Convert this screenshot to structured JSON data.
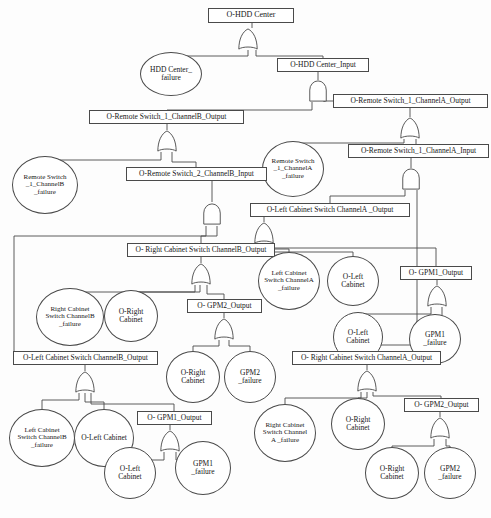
{
  "diagram": {
    "type": "fault-tree",
    "caption": "",
    "stroke_color": "#4a4a4a",
    "background_color": "#fdfdfd",
    "text_color": "#161616"
  },
  "nodes": [
    {
      "id": "n0",
      "label": "O-HDD Center",
      "shape": "rect",
      "x": 208,
      "y": 8,
      "w": 86,
      "h": 15,
      "font": 8
    },
    {
      "id": "n1",
      "label": "HDD Center_\nfailure",
      "shape": "circle",
      "x": 140,
      "y": 52,
      "w": 62,
      "h": 44,
      "font": 7.5
    },
    {
      "id": "n2",
      "label": "O-HDD Center_Input",
      "shape": "rect",
      "x": 277,
      "y": 58,
      "w": 92,
      "h": 14,
      "font": 7.5
    },
    {
      "id": "n3",
      "label": "O-Remote Switch_1_ChannelA_Output",
      "shape": "rect",
      "x": 333,
      "y": 94,
      "w": 155,
      "h": 14,
      "font": 7.5
    },
    {
      "id": "n4",
      "label": "O-Remote Switch_1_ChannelB_Output",
      "shape": "rect",
      "x": 89,
      "y": 110,
      "w": 155,
      "h": 14,
      "font": 7.5
    },
    {
      "id": "n5",
      "label": "O-Remote Switch_1_ChannelA_Input",
      "shape": "rect",
      "x": 348,
      "y": 144,
      "w": 141,
      "h": 14,
      "font": 7.5
    },
    {
      "id": "n6",
      "label": "Remote Switch\n_1_ChannelA\n_failure",
      "shape": "circle",
      "x": 262,
      "y": 141,
      "w": 62,
      "h": 56,
      "font": 7
    },
    {
      "id": "n7",
      "label": "O-Remote Switch_2_ChannelB_Input",
      "shape": "rect",
      "x": 126,
      "y": 167,
      "w": 141,
      "h": 14,
      "font": 7.5
    },
    {
      "id": "n8",
      "label": "Remote Switch\n_1_ChannelB\n_failure",
      "shape": "circle",
      "x": 12,
      "y": 156,
      "w": 66,
      "h": 58,
      "font": 7
    },
    {
      "id": "n9",
      "label": "O-Left Cabinet Switch ChannelA _Output",
      "shape": "rect",
      "x": 250,
      "y": 203,
      "w": 160,
      "h": 14,
      "font": 7.5
    },
    {
      "id": "n10",
      "label": "O- Right Cabinet Switch ChannelB_Output",
      "shape": "rect",
      "x": 127,
      "y": 243,
      "w": 148,
      "h": 14,
      "font": 7.5
    },
    {
      "id": "n11",
      "label": "Left Cabinet\nSwitch ChannelA\n_failure",
      "shape": "circle",
      "x": 258,
      "y": 252,
      "w": 62,
      "h": 58,
      "font": 7
    },
    {
      "id": "n12",
      "label": "O-Left\nCabinet",
      "shape": "circle",
      "x": 327,
      "y": 256,
      "w": 52,
      "h": 50,
      "font": 7.5
    },
    {
      "id": "n13",
      "label": "O- GPM1_Output",
      "shape": "rect",
      "x": 400,
      "y": 266,
      "w": 72,
      "h": 14,
      "font": 7.5
    },
    {
      "id": "n14",
      "label": "Right Cabinet\nSwitch ChannelB\n_failure",
      "shape": "circle",
      "x": 36,
      "y": 288,
      "w": 68,
      "h": 58,
      "font": 7
    },
    {
      "id": "n15",
      "label": "O-Right\nCabinet",
      "shape": "circle",
      "x": 104,
      "y": 290,
      "w": 54,
      "h": 52,
      "font": 7.5
    },
    {
      "id": "n16",
      "label": "O- GPM2_Output",
      "shape": "rect",
      "x": 187,
      "y": 299,
      "w": 75,
      "h": 14,
      "font": 7.5
    },
    {
      "id": "n17",
      "label": "O-Left\nCabinet",
      "shape": "circle",
      "x": 333,
      "y": 312,
      "w": 50,
      "h": 50,
      "font": 7.5
    },
    {
      "id": "n18",
      "label": "GPM1\n_failure",
      "shape": "circle",
      "x": 409,
      "y": 314,
      "w": 52,
      "h": 50,
      "font": 7.5
    },
    {
      "id": "n19",
      "label": "O-Left Cabinet Switch ChannelB_Output",
      "shape": "rect",
      "x": 13,
      "y": 351,
      "w": 145,
      "h": 14,
      "font": 7.5
    },
    {
      "id": "n20",
      "label": "O-Right\nCabinet",
      "shape": "circle",
      "x": 166,
      "y": 351,
      "w": 54,
      "h": 52,
      "font": 7.5
    },
    {
      "id": "n21",
      "label": "GPM2\n_failure",
      "shape": "circle",
      "x": 224,
      "y": 351,
      "w": 52,
      "h": 52,
      "font": 7.5
    },
    {
      "id": "n22",
      "label": "O- Right Cabinet Switch ChannelA_Output",
      "shape": "rect",
      "x": 292,
      "y": 351,
      "w": 149,
      "h": 14,
      "font": 7.5
    },
    {
      "id": "n23",
      "label": "O- GPM2_Output",
      "shape": "rect",
      "x": 404,
      "y": 398,
      "w": 75,
      "h": 14,
      "font": 7.5
    },
    {
      "id": "n24",
      "label": "Right Cabinet\nSwitch Channel\nA _failure",
      "shape": "circle",
      "x": 254,
      "y": 404,
      "w": 62,
      "h": 58,
      "font": 7
    },
    {
      "id": "n25",
      "label": "O-Right\nCabinet",
      "shape": "circle",
      "x": 331,
      "y": 398,
      "w": 54,
      "h": 52,
      "font": 7.5
    },
    {
      "id": "n26",
      "label": "Left Cabinet\nSwitch ChannelB\n_failure",
      "shape": "circle",
      "x": 9,
      "y": 409,
      "w": 66,
      "h": 58,
      "font": 7
    },
    {
      "id": "n27",
      "label": "O-Left Cabinet",
      "shape": "circle",
      "x": 74,
      "y": 409,
      "w": 60,
      "h": 58,
      "font": 7.5
    },
    {
      "id": "n28",
      "label": "O- GPM1_Output",
      "shape": "rect",
      "x": 137,
      "y": 411,
      "w": 75,
      "h": 14,
      "font": 7.5
    },
    {
      "id": "n29",
      "label": "O-Left\nCabinet",
      "shape": "circle",
      "x": 104,
      "y": 447,
      "w": 52,
      "h": 52,
      "font": 7.5
    },
    {
      "id": "n30",
      "label": "GPM1\n_failure",
      "shape": "circle",
      "x": 175,
      "y": 441,
      "w": 56,
      "h": 54,
      "font": 7.5
    },
    {
      "id": "n31",
      "label": "O-Right\nCabinet",
      "shape": "circle",
      "x": 365,
      "y": 447,
      "w": 54,
      "h": 52,
      "font": 7.5
    },
    {
      "id": "n32",
      "label": "GPM2\n_failure",
      "shape": "circle",
      "x": 424,
      "y": 447,
      "w": 52,
      "h": 52,
      "font": 7.5
    }
  ],
  "gates": [
    {
      "id": "g0",
      "kind": "or",
      "x": 236,
      "y": 28,
      "w": 24,
      "h": 22,
      "parent": "n0",
      "name": "or-gate-hdd-center"
    },
    {
      "id": "g1",
      "kind": "and",
      "x": 307,
      "y": 80,
      "w": 22,
      "h": 22,
      "parent": "n2",
      "name": "and-gate-hdd-center-input"
    },
    {
      "id": "g2",
      "kind": "or",
      "x": 155,
      "y": 130,
      "w": 24,
      "h": 22,
      "parent": "n4",
      "name": "or-gate-remote-switch1-channelb-output"
    },
    {
      "id": "g3",
      "kind": "or",
      "x": 398,
      "y": 117,
      "w": 24,
      "h": 22,
      "parent": "n3",
      "name": "or-gate-remote-switch1-channela-output"
    },
    {
      "id": "g4",
      "kind": "and",
      "x": 400,
      "y": 168,
      "w": 22,
      "h": 22,
      "parent": "n5",
      "name": "and-gate-remote-switch1-channela-input"
    },
    {
      "id": "g5",
      "kind": "and",
      "x": 201,
      "y": 202,
      "w": 22,
      "h": 24,
      "parent": "n7",
      "name": "and-gate-remote-switch2-channelb-input"
    },
    {
      "id": "g6",
      "kind": "or",
      "x": 252,
      "y": 222,
      "w": 24,
      "h": 22,
      "parent": "n9",
      "name": "or-gate-left-cabinet-switch-channela-output"
    },
    {
      "id": "g7",
      "kind": "or",
      "x": 189,
      "y": 263,
      "w": 24,
      "h": 22,
      "parent": "n10",
      "name": "or-gate-right-cabinet-switch-channelb-output"
    },
    {
      "id": "g8",
      "kind": "or",
      "x": 425,
      "y": 285,
      "w": 24,
      "h": 22,
      "parent": "n13",
      "name": "or-gate-gpm1-output-right"
    },
    {
      "id": "g9",
      "kind": "or",
      "x": 212,
      "y": 318,
      "w": 24,
      "h": 22,
      "parent": "n16",
      "name": "or-gate-gpm2-output-mid"
    },
    {
      "id": "g10",
      "kind": "or",
      "x": 73,
      "y": 371,
      "w": 24,
      "h": 22,
      "parent": "n19",
      "name": "or-gate-left-cabinet-switch-channelb-output"
    },
    {
      "id": "g11",
      "kind": "or",
      "x": 355,
      "y": 370,
      "w": 24,
      "h": 22,
      "parent": "n22",
      "name": "or-gate-right-cabinet-switch-channela-output"
    },
    {
      "id": "g12",
      "kind": "or",
      "x": 158,
      "y": 430,
      "w": 24,
      "h": 22,
      "parent": "n28",
      "name": "or-gate-gpm1-output-bottom"
    },
    {
      "id": "g13",
      "kind": "or",
      "x": 428,
      "y": 417,
      "w": 24,
      "h": 22,
      "parent": "n23",
      "name": "or-gate-gpm2-output-bottom"
    }
  ],
  "edges": [
    {
      "from": "g0",
      "to": "n1",
      "name": "edge-hdd-center-to-failure"
    },
    {
      "from": "g0",
      "to": "n2",
      "name": "edge-hdd-center-to-input"
    },
    {
      "from": "g1",
      "to": "n4",
      "name": "edge-input-to-channelb-output"
    },
    {
      "from": "g1",
      "to": "n3",
      "name": "edge-input-to-channela-output"
    },
    {
      "from": "g2",
      "to": "n8",
      "name": "edge-channelb-to-switch-failure"
    },
    {
      "from": "g2",
      "to": "n7",
      "name": "edge-channelb-to-switch2-input"
    },
    {
      "from": "g3",
      "to": "n6",
      "name": "edge-channela-to-switch-failure"
    },
    {
      "from": "g3",
      "to": "n5",
      "name": "edge-channela-to-switch1-input"
    },
    {
      "from": "g4",
      "to": "n9",
      "name": "edge-channela-input-to-left-cabinet"
    },
    {
      "from": "g4",
      "to": "n22",
      "name": "edge-channela-input-to-right-cabinet"
    },
    {
      "from": "g5",
      "to": "n10",
      "name": "edge-switch2-to-right-channelb"
    },
    {
      "from": "g5",
      "to": "n19",
      "name": "edge-switch2-to-left-channelb"
    },
    {
      "from": "g6",
      "to": "n11",
      "name": "edge-lca-to-failure"
    },
    {
      "from": "g6",
      "to": "n12",
      "name": "edge-lca-to-left-cabinet"
    },
    {
      "from": "g6",
      "to": "n13",
      "name": "edge-lca-to-gpm1"
    },
    {
      "from": "g7",
      "to": "n14",
      "name": "edge-rcb-to-failure"
    },
    {
      "from": "g7",
      "to": "n15",
      "name": "edge-rcb-to-right-cabinet"
    },
    {
      "from": "g7",
      "to": "n16",
      "name": "edge-rcb-to-gpm2"
    },
    {
      "from": "g8",
      "to": "n17",
      "name": "edge-gpm1-to-left-cabinet"
    },
    {
      "from": "g8",
      "to": "n18",
      "name": "edge-gpm1-to-failure"
    },
    {
      "from": "g9",
      "to": "n20",
      "name": "edge-gpm2-to-right-cabinet"
    },
    {
      "from": "g9",
      "to": "n21",
      "name": "edge-gpm2-to-failure"
    },
    {
      "from": "g10",
      "to": "n26",
      "name": "edge-lcb-to-failure"
    },
    {
      "from": "g10",
      "to": "n27",
      "name": "edge-lcb-to-left-cabinet"
    },
    {
      "from": "g10",
      "to": "n28",
      "name": "edge-lcb-to-gpm1"
    },
    {
      "from": "g11",
      "to": "n24",
      "name": "edge-rca-to-failure"
    },
    {
      "from": "g11",
      "to": "n25",
      "name": "edge-rca-to-right-cabinet"
    },
    {
      "from": "g11",
      "to": "n23",
      "name": "edge-rca-to-gpm2"
    },
    {
      "from": "g12",
      "to": "n29",
      "name": "edge-gpm1b-to-left-cabinet"
    },
    {
      "from": "g12",
      "to": "n30",
      "name": "edge-gpm1b-to-failure"
    },
    {
      "from": "g13",
      "to": "n31",
      "name": "edge-gpm2b-to-right-cabinet"
    },
    {
      "from": "g13",
      "to": "n32",
      "name": "edge-gpm2b-to-failure"
    }
  ],
  "wire_paths": [
    "M252,23 L252,28",
    "M248,50 L248,56 L171,56 L171,52",
    "M256,50 L256,56 L323,56 L323,58",
    "M318,72 L318,80",
    "M312,102 L312,110 L167,110",
    "M324,102 L324,101 L333,101",
    "M167,124 L167,130",
    "M161,152 L161,160 L45,160 L45,156",
    "M172,152 L172,162 L196,162 L196,167",
    "M410,108 L410,117",
    "M404,139 L404,143 L293,143 L293,141",
    "M416,139 L416,144",
    "M411,158 L411,168",
    "M405,190 L405,196 L330,196 L330,203",
    "M417,190 L417,345 L366,345 L366,351",
    "M212,181 L212,202",
    "M206,226 L206,236 L201,236 L201,243",
    "M217,226 L217,236 L14,236 L14,358 L13,358",
    "M264,217 L264,222",
    "M258,244 L258,249 L289,249 L289,252",
    "M265,244 L265,252 L353,252 L353,256",
    "M270,244 L270,248 L436,248 L436,266",
    "M201,257 L201,263",
    "M195,285 L195,292 L131,292 L131,290",
    "M200,285 L200,292 L70,292 L70,288",
    "M207,285 L207,294 L224,294 L224,299",
    "M437,280 L437,285",
    "M431,307 L431,314 L358,314 L358,312",
    "M442,307 L442,320 L435,320 L435,314",
    "M224,313 L224,318",
    "M219,340 L219,346 L193,346 L193,351",
    "M229,340 L229,346 L250,346 L250,351",
    "M85,365 L85,371",
    "M79,393 L79,400 L42,400 L42,409",
    "M85,393 L85,402 L104,402 L104,409",
    "M91,393 L91,404 L174,404 L174,411",
    "M367,365 L367,370",
    "M361,392 L361,398 L285,398 L285,404",
    "M367,392 L367,398 L358,398 L358,398",
    "M373,392 L373,396 L441,396 L441,398",
    "M170,425 L170,430",
    "M164,452 L164,460 L130,460 L130,447",
    "M176,452 L176,460 L203,460 L203,441",
    "M440,412 L440,417",
    "M434,439 L434,446 L392,446 L392,447",
    "M446,439 L446,446 L450,446 L450,447"
  ]
}
